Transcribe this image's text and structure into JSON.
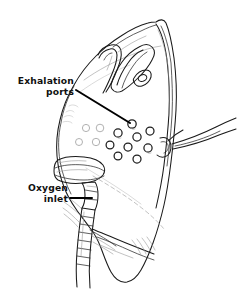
{
  "figure": {
    "background_color": "#ffffff",
    "ink_color": "#1a1a1a",
    "shade_color": "#8a8a8a",
    "leader_color": "#000000",
    "width": 237,
    "height": 290
  },
  "labels": [
    {
      "id": "exhalation-ports",
      "line1": "Exhalation",
      "line2": "ports",
      "x1": 74,
      "y1": 84,
      "x2": 75,
      "y2": 95,
      "leader_start_x": 76,
      "leader_start_y": 90,
      "leader_end_x": 131,
      "leader_end_y": 124
    },
    {
      "id": "oxygen-inlet",
      "line1": "Oxygen",
      "line2": "inlet",
      "x1": 68,
      "y1": 190,
      "x2": 68,
      "y2": 202,
      "leader_start_x": 70,
      "leader_start_y": 198,
      "leader_end_x": 92,
      "leader_end_y": 198
    }
  ],
  "parts": [
    {
      "name": "nose-clip",
      "label": "Nose bridge clip"
    },
    {
      "name": "mask-body",
      "label": "Mask shell"
    },
    {
      "name": "exhalation-port-cluster",
      "label": "Exhalation ports",
      "count": 12
    },
    {
      "name": "oxygen-inlet-connector",
      "label": "Oxygen inlet connector"
    },
    {
      "name": "oxygen-tubing",
      "label": "Corrugated oxygen tubing"
    },
    {
      "name": "head-strap",
      "label": "Elastic head strap"
    },
    {
      "name": "chin-cup",
      "label": "Chin portion"
    }
  ],
  "exhalation_ports": [
    {
      "cx": 132,
      "cy": 124,
      "r": 4.2
    },
    {
      "cx": 150,
      "cy": 131,
      "r": 4.0
    },
    {
      "cx": 118,
      "cy": 133,
      "r": 4.1
    },
    {
      "cx": 137,
      "cy": 137,
      "r": 4.1
    },
    {
      "cx": 100,
      "cy": 128,
      "r": 3.8
    },
    {
      "cx": 86,
      "cy": 128,
      "r": 3.6
    },
    {
      "cx": 148,
      "cy": 148,
      "r": 4.1
    },
    {
      "cx": 128,
      "cy": 147,
      "r": 4.0
    },
    {
      "cx": 110,
      "cy": 145,
      "r": 3.9
    },
    {
      "cx": 96,
      "cy": 142,
      "r": 3.7
    },
    {
      "cx": 137,
      "cy": 159,
      "r": 4.0
    },
    {
      "cx": 118,
      "cy": 156,
      "r": 3.9
    },
    {
      "cx": 79,
      "cy": 142,
      "r": 3.5
    }
  ]
}
